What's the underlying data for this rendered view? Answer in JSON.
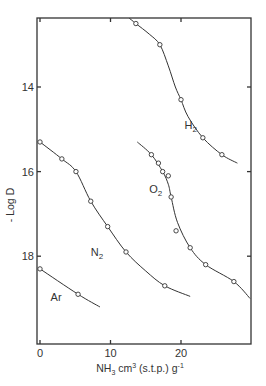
{
  "chart_data": {
    "type": "line",
    "title": "",
    "xlabel": "NH3 cm3 (s.t.p.) g-1",
    "xlabel_parts": {
      "main": "NH",
      "sub": "3",
      "mid": " cm",
      "sup": "3",
      "rest": " (s.t.p.) g",
      "sup2": "-1"
    },
    "ylabel": "- Log D",
    "xlim": [
      0,
      30
    ],
    "ylim": [
      20.1,
      12.4
    ],
    "y_inverted": true,
    "xticks": [
      0,
      10,
      20
    ],
    "xtick_labels": [
      "0",
      "10",
      "20"
    ],
    "yticks": [
      14,
      16,
      18
    ],
    "ytick_labels": [
      "14",
      "16",
      "18"
    ],
    "grid": false,
    "series": [
      {
        "name": "H2",
        "label_main": "H",
        "label_sub": "2",
        "label_at": [
          20.5,
          15.0
        ],
        "points": [
          [
            13.6,
            12.5
          ],
          [
            17.0,
            13.0
          ],
          [
            20.0,
            14.3
          ],
          [
            23.1,
            15.2
          ],
          [
            25.8,
            15.6
          ]
        ],
        "curve": [
          [
            12.5,
            12.35
          ],
          [
            13.6,
            12.5
          ],
          [
            15.5,
            12.75
          ],
          [
            17.0,
            13.0
          ],
          [
            18.2,
            13.5
          ],
          [
            19.2,
            14.0
          ],
          [
            20.0,
            14.3
          ],
          [
            21.0,
            14.7
          ],
          [
            23.1,
            15.2
          ],
          [
            25.8,
            15.6
          ],
          [
            28.0,
            15.8
          ]
        ]
      },
      {
        "name": "O2",
        "label_main": "O",
        "label_sub": "2",
        "label_at": [
          15.5,
          16.5
        ],
        "points": [
          [
            15.8,
            15.6
          ],
          [
            16.8,
            15.8
          ],
          [
            17.4,
            16.0
          ],
          [
            18.2,
            16.1
          ],
          [
            18.6,
            16.6
          ],
          [
            19.3,
            17.4
          ],
          [
            21.3,
            17.8
          ],
          [
            23.5,
            18.2
          ],
          [
            27.5,
            18.6
          ]
        ],
        "curve": [
          [
            13.8,
            15.3
          ],
          [
            15.8,
            15.6
          ],
          [
            17.4,
            16.0
          ],
          [
            18.2,
            16.3
          ],
          [
            18.6,
            16.6
          ],
          [
            19.5,
            17.2
          ],
          [
            21.3,
            17.8
          ],
          [
            23.5,
            18.2
          ],
          [
            27.5,
            18.6
          ],
          [
            29.8,
            19.0
          ]
        ]
      },
      {
        "name": "N2",
        "label_main": "N",
        "label_sub": "2",
        "label_at": [
          7.2,
          18.0
        ],
        "points": [
          [
            0,
            15.3
          ],
          [
            3.1,
            15.7
          ],
          [
            5.1,
            16.0
          ],
          [
            7.2,
            16.7
          ],
          [
            9.6,
            17.3
          ],
          [
            12.2,
            17.9
          ],
          [
            17.7,
            18.7
          ]
        ],
        "curve": [
          [
            0,
            15.3
          ],
          [
            3.1,
            15.7
          ],
          [
            5.1,
            16.0
          ],
          [
            7.2,
            16.7
          ],
          [
            9.6,
            17.3
          ],
          [
            12.2,
            17.9
          ],
          [
            15.0,
            18.35
          ],
          [
            17.7,
            18.7
          ],
          [
            21.3,
            18.95
          ]
        ]
      },
      {
        "name": "Ar",
        "label_main": "Ar",
        "label_sub": "",
        "label_at": [
          1.5,
          19.05
        ],
        "points": [
          [
            0,
            18.3
          ],
          [
            5.4,
            18.9
          ]
        ],
        "curve": [
          [
            0,
            18.3
          ],
          [
            5.4,
            18.9
          ],
          [
            8.5,
            19.2
          ]
        ]
      }
    ]
  }
}
